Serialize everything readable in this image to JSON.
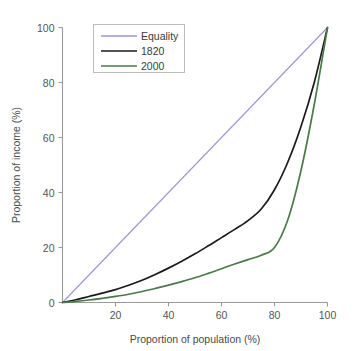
{
  "chart_data": {
    "type": "line",
    "title": "",
    "xlabel": "Proportion of population (%)",
    "ylabel": "Proportion of income (%)",
    "xlim": [
      0,
      100
    ],
    "ylim": [
      0,
      100
    ],
    "xticks": [
      20,
      40,
      60,
      80,
      100
    ],
    "yticks": [
      0,
      20,
      40,
      60,
      80,
      100
    ],
    "xtick_labels": [
      "20",
      "40",
      "60",
      "80",
      "100"
    ],
    "ytick_labels": [
      "0",
      "20",
      "40",
      "60",
      "80",
      "100"
    ],
    "grid": false,
    "legend_position": "upper-left-inside",
    "x": [
      0,
      5,
      10,
      15,
      20,
      25,
      30,
      35,
      40,
      45,
      50,
      55,
      60,
      65,
      70,
      75,
      80,
      85,
      90,
      95,
      100
    ],
    "series": [
      {
        "name": "Equality",
        "color": "#9a96d4",
        "values": [
          0,
          5,
          10,
          15,
          20,
          25,
          30,
          35,
          40,
          45,
          50,
          55,
          60,
          65,
          70,
          75,
          80,
          85,
          90,
          95,
          100
        ]
      },
      {
        "name": "1820",
        "color": "#1a1a1a",
        "values": [
          0,
          1.0,
          2.2,
          3.4,
          4.7,
          6.3,
          8.1,
          10.2,
          12.5,
          15.0,
          17.7,
          20.6,
          23.6,
          26.6,
          29.8,
          34.0,
          41.0,
          51.0,
          64.0,
          80.0,
          100
        ]
      },
      {
        "name": "2000",
        "color": "#4a7a4a",
        "values": [
          0,
          0.4,
          0.9,
          1.5,
          2.2,
          3.0,
          4.0,
          5.1,
          6.3,
          7.6,
          9.0,
          10.6,
          12.3,
          14.0,
          15.6,
          17.2,
          20.0,
          30.0,
          48.0,
          72.0,
          100
        ]
      }
    ]
  },
  "legend": {
    "entries": [
      {
        "label": "Equality"
      },
      {
        "label": "1820"
      },
      {
        "label": "2000"
      }
    ]
  },
  "axes": {
    "x_title": "Proportion of population (%)",
    "y_title": "Proportion of income (%)"
  }
}
